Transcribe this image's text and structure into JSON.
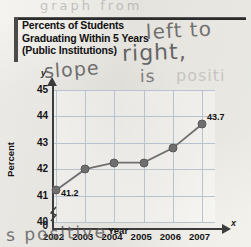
{
  "figure": {
    "title_lines": [
      "Percents of Students",
      "Graduating Within 5 Years",
      "(Public Institutions)"
    ],
    "y_axis_letter": "y",
    "x_axis_letter": "x"
  },
  "annotations": {
    "top_faint": "graph from",
    "left_to": "left to",
    "right": "right,",
    "slope": "slope",
    "is": "is",
    "positive_faint": "positi",
    "positive": "s positive"
  },
  "chart_data": {
    "type": "line",
    "title": "Percents of Students Graduating Within 5 Years (Public Institutions)",
    "xlabel": "Year",
    "ylabel": "Percent",
    "categories": [
      "2002",
      "2003",
      "2004",
      "2005",
      "2006",
      "2007"
    ],
    "x": [
      2002,
      2003,
      2004,
      2005,
      2006,
      2007
    ],
    "values": [
      41.2,
      42.0,
      42.25,
      42.25,
      42.8,
      43.7
    ],
    "point_labels": [
      "41.2",
      "",
      "",
      "",
      "",
      "43.7"
    ],
    "ylim": [
      40,
      45
    ],
    "yticks": [
      "45",
      "44",
      "43",
      "42",
      "41",
      "40",
      "0"
    ],
    "xticks": [
      "2002",
      "2003",
      "2004",
      "2005",
      "2006",
      "2007"
    ],
    "grid": true,
    "axis_break": true,
    "legend": "none",
    "line_color": "#6f6f6f",
    "grid_color": "#b9c2cf",
    "axis_color": "#3c3c3c"
  }
}
